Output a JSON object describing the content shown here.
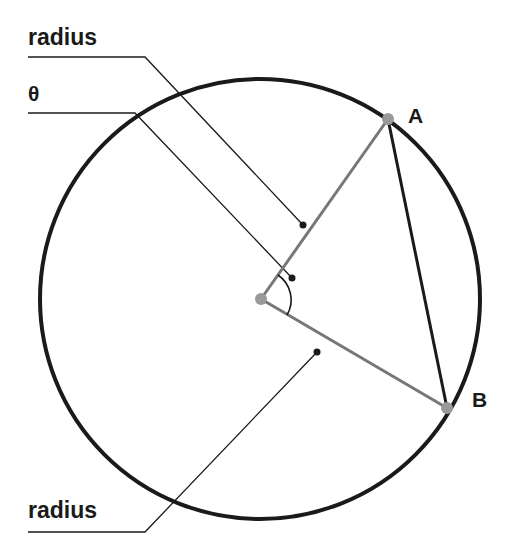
{
  "diagram": {
    "labels": {
      "radius_top": "radius",
      "theta": "θ",
      "radius_bottom": "radius",
      "point_a": "A",
      "point_b": "B"
    },
    "colors": {
      "circle": "#1a1a1a",
      "radius_line": "#777777",
      "chord": "#1a1a1a",
      "leader": "#1a1a1a",
      "point": "#999999"
    },
    "circle": {
      "cx": 260,
      "cy": 299,
      "r": 220
    },
    "points": {
      "center": [
        261,
        299
      ],
      "A": [
        388,
        119
      ],
      "B": [
        447,
        408
      ]
    }
  }
}
